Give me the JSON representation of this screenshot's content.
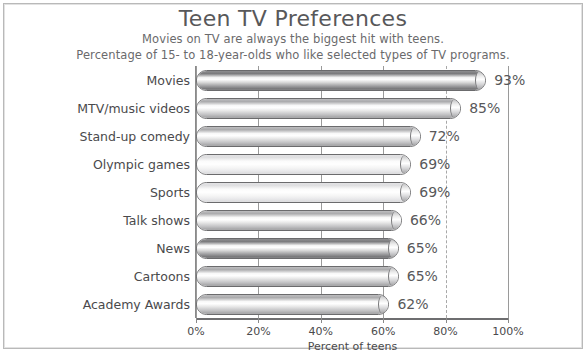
{
  "chart_data": {
    "type": "bar",
    "orientation": "horizontal",
    "title": "Teen TV Preferences",
    "subtitle_line1": "Movies on TV are always the biggest hit with teens.",
    "subtitle_line2": "Percentage of 15- to 18-year-olds who like selected types of TV programs.",
    "xlabel": "Percent of teens",
    "ylabel": "",
    "xlim": [
      0,
      100
    ],
    "xticks": [
      0,
      20,
      40,
      60,
      80,
      100
    ],
    "xtick_labels": [
      "0%",
      "20%",
      "40%",
      "60%",
      "80%",
      "100%"
    ],
    "grid": true,
    "legend": "none",
    "categories": [
      "Movies",
      "MTV/music videos",
      "Stand-up comedy",
      "Olympic games",
      "Sports",
      "Talk shows",
      "News",
      "Cartoons",
      "Academy Awards"
    ],
    "values": [
      93,
      85,
      72,
      69,
      69,
      66,
      65,
      65,
      62
    ],
    "value_labels": [
      "93%",
      "85%",
      "72%",
      "69%",
      "69%",
      "66%",
      "65%",
      "65%",
      "62%"
    ],
    "bar_shades": [
      "dark",
      "mid",
      "mid",
      "light",
      "light",
      "mid",
      "dark",
      "mid",
      "mid"
    ],
    "colors": {
      "bar_outline": "#6b6b6d",
      "text": "#4a4a4c",
      "title_text": "#58585a",
      "gridline": "#9a9a9a",
      "axis": "#6e6e70",
      "background": "#ffffff",
      "frame_border": "#b9b9b9"
    }
  },
  "source_note": ""
}
